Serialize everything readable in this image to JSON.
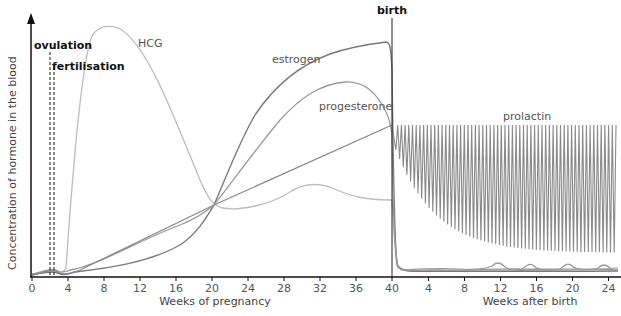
{
  "chart_data": {
    "type": "line",
    "title": "",
    "ylabel": "Concentration of hormone in the blood",
    "xlabel_pregnancy": "Weeks of pregnancy",
    "xlabel_after_birth": "Weeks after birth",
    "x_ticks_pregnancy": [
      "0",
      "4",
      "8",
      "12",
      "16",
      "20",
      "24",
      "28",
      "32",
      "36",
      "40"
    ],
    "x_ticks_after_birth": [
      "4",
      "8",
      "12",
      "16",
      "20",
      "24"
    ],
    "grid": false,
    "legend": "none (inline curve labels)",
    "annotations": [
      {
        "label": "ovulation",
        "week": 2,
        "style": "dashed vertical line"
      },
      {
        "label": "fertilisation",
        "week": 2.5,
        "style": "dashed vertical line"
      },
      {
        "label": "birth",
        "week": 40,
        "style": "solid vertical line"
      }
    ],
    "series": [
      {
        "name": "HCG",
        "x_weeks": [
          0,
          2,
          3.5,
          5,
          6,
          8,
          10,
          12,
          14,
          16,
          18,
          20,
          22,
          24,
          28,
          31,
          34,
          37,
          40,
          40.5,
          42,
          64
        ],
        "values_relative": [
          0.02,
          0.04,
          0.03,
          0.4,
          0.85,
          1.0,
          0.95,
          0.8,
          0.6,
          0.45,
          0.3,
          0.3,
          0.28,
          0.28,
          0.35,
          0.37,
          0.32,
          0.31,
          0.3,
          0.02,
          0.02,
          0.03
        ]
      },
      {
        "name": "estrogen",
        "x_weeks": [
          0,
          4,
          8,
          12,
          16,
          20,
          24,
          28,
          32,
          36,
          39.5,
          40,
          41,
          64
        ],
        "values_relative": [
          0.01,
          0.02,
          0.05,
          0.1,
          0.18,
          0.3,
          0.55,
          0.72,
          0.84,
          0.91,
          0.93,
          0.9,
          0.03,
          0.02
        ]
      },
      {
        "name": "progesterone",
        "x_weeks": [
          0,
          4,
          8,
          12,
          16,
          20,
          24,
          28,
          32,
          35,
          38,
          40,
          41,
          64
        ],
        "values_relative": [
          0.01,
          0.03,
          0.1,
          0.17,
          0.24,
          0.3,
          0.48,
          0.62,
          0.74,
          0.77,
          0.7,
          0.6,
          0.03,
          0.02
        ]
      },
      {
        "name": "prolactin",
        "x_weeks": [
          0,
          4,
          8,
          12,
          16,
          20,
          24,
          28,
          32,
          36,
          40,
          42,
          48,
          56,
          64
        ],
        "values_relative": [
          0.02,
          0.03,
          0.09,
          0.15,
          0.21,
          0.3,
          0.36,
          0.42,
          0.48,
          0.54,
          0.6,
          "oscillating 0.6/0.45",
          "oscillating 0.6/0.2",
          "oscillating 0.6/0.1",
          "oscillating 0.6/0.1"
        ]
      }
    ]
  },
  "labels": {
    "ylabel": "Concentration of hormone in the blood",
    "xlabel_pregnancy": "Weeks of pregnancy",
    "xlabel_after_birth": "Weeks after birth",
    "ovulation": "ovulation",
    "fertilisation": "fertilisation",
    "birth": "birth",
    "hcg": "HCG",
    "estrogen": "estrogen",
    "progesterone": "progesterone",
    "prolactin": "prolactin"
  },
  "ticks": {
    "pregnancy": [
      "0",
      "4",
      "8",
      "12",
      "16",
      "20",
      "24",
      "28",
      "32",
      "36",
      "40"
    ],
    "after_birth": [
      "4",
      "8",
      "12",
      "16",
      "20",
      "24"
    ]
  },
  "colors": {
    "axis": "#111111",
    "hcg": "#b8b8b8",
    "estrogen": "#7a7a7a",
    "progesterone": "#999999",
    "prolactin": "#8a8a8a"
  }
}
